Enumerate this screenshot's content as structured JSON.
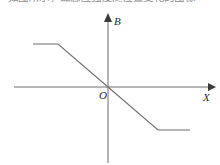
{
  "header": {
    "text": "如图所示，磁感应强度随位置变化的图像"
  },
  "figure": {
    "name": "magnetic-field-vs-position-graph",
    "background_color": "#ffffff",
    "line_color": "#6e6e73",
    "axis_color": "#6e6e73",
    "label_color": "#2b2b2b",
    "axes": {
      "x_axis": {
        "label": "X",
        "label_x": 203,
        "label_y": 100,
        "start_x": 14,
        "end_x": 212,
        "y": 87,
        "arrow": "right"
      },
      "y_axis": {
        "label": "B",
        "label_x": 114,
        "label_y": 25,
        "x": 108,
        "start_y": 163,
        "end_y": 16,
        "arrow": "up"
      },
      "origin": {
        "label": "O",
        "x": 108,
        "y": 87,
        "label_x": 99,
        "label_y": 99
      }
    }
  },
  "chart_data": {
    "type": "line",
    "title": "",
    "subtitle": "",
    "xlabel": "X",
    "ylabel": "B",
    "grid": false,
    "legend": null,
    "annotations": [
      "O"
    ],
    "series": [
      {
        "name": "B(X)",
        "points_px": [
          [
            33,
            44
          ],
          [
            58,
            44
          ],
          [
            108,
            87
          ],
          [
            158,
            130
          ],
          [
            190,
            130
          ]
        ],
        "x": [
          -3.1,
          -2.0,
          0.0,
          2.0,
          3.3
        ],
        "values": [
          1.0,
          1.0,
          0.0,
          -1.0,
          -1.0
        ]
      }
    ],
    "xlim": [
      -3.9,
      4.3
    ],
    "ylim": [
      -1.75,
      1.65
    ]
  }
}
